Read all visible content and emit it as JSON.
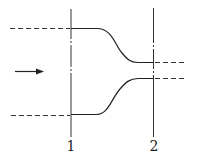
{
  "diagram": {
    "type": "flow-contraction",
    "sections": [
      {
        "label": "1",
        "x": 71
      },
      {
        "label": "2",
        "x": 153
      }
    ],
    "flow_direction": "left-to-right",
    "icons": {
      "flow": "arrow-right-icon"
    },
    "colors": {
      "stroke": "#222222",
      "background": "#ffffff"
    }
  }
}
